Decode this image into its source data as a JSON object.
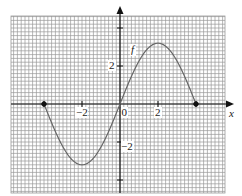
{
  "chart_data": {
    "type": "line",
    "title": "",
    "xlabel": "x",
    "ylabel": "",
    "function_label": "f",
    "xlim": [
      -5.7,
      5.5
    ],
    "ylim": [
      -4.7,
      4.6
    ],
    "grid": true,
    "grid_minor_step": 0.2,
    "x_ticks": [
      -2,
      0,
      2
    ],
    "y_ticks": [
      2,
      -2
    ],
    "tick_labels": {
      "x_neg2": "−2",
      "origin": "0",
      "x_2": "2",
      "y_2": "2",
      "y_neg2": "−2"
    },
    "series": [
      {
        "name": "f",
        "description": "approximately 3.2*sin(pi*x/4) on [-4,4]",
        "x": [
          -4,
          -3,
          -2,
          -1,
          0,
          1,
          2,
          3,
          4
        ],
        "values": [
          0,
          -2.26,
          -3.2,
          -2.26,
          0,
          2.26,
          3.2,
          2.26,
          0
        ]
      }
    ],
    "endpoints": [
      {
        "x": -4,
        "y": 0,
        "closed": true
      },
      {
        "x": 4,
        "y": 0,
        "closed": true
      }
    ]
  },
  "colors": {
    "grid": "#9a9a9a",
    "axis": "#111111",
    "curve": "#666666",
    "background": "#ffffff"
  }
}
